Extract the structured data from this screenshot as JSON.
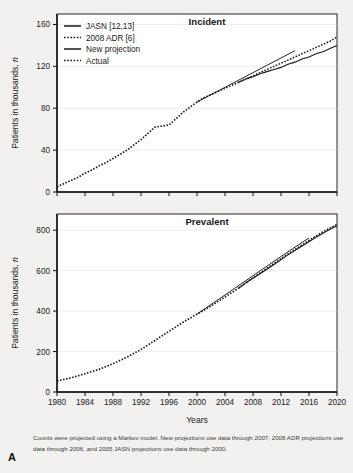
{
  "figure": {
    "panel_letter": "A",
    "caption": "Counts were projected using a Markov model. New projections use data through 2007, 2008 ADR projections use data through 2006, and 2005 JASN projections use data through 2000.",
    "xlabel": "Years"
  },
  "legend": {
    "position": "top-left",
    "items": [
      {
        "label": "JASN  [12,13]",
        "style": "solid"
      },
      {
        "label": "2008 ADR [6]",
        "style": "dotted"
      },
      {
        "label": "New projection",
        "style": "solid"
      },
      {
        "label": "Actual",
        "style": "dotted"
      }
    ]
  },
  "chart_data": [
    {
      "type": "line",
      "title": "Incident",
      "xlabel": "Years",
      "ylabel": "Patients in thousands, n",
      "xlim": [
        1980,
        2020
      ],
      "ylim": [
        0,
        170
      ],
      "yticks": [
        0,
        40,
        80,
        120,
        160
      ],
      "xticks": [
        1980,
        1984,
        1988,
        1992,
        1996,
        2000,
        2004,
        2008,
        2012,
        2016,
        2020
      ],
      "grid": true,
      "series": [
        {
          "name": "Actual",
          "style": "dotted",
          "x": [
            1980,
            1981,
            1982,
            1983,
            1984,
            1985,
            1986,
            1987,
            1988,
            1989,
            1990,
            1991,
            1992,
            1993,
            1994,
            1995,
            1996,
            1997,
            1998,
            1999,
            2000,
            2001,
            2002,
            2003,
            2004,
            2005,
            2006,
            2007
          ],
          "values": [
            5,
            8,
            11,
            14,
            18,
            21,
            25,
            28,
            32,
            36,
            40,
            45,
            50,
            56,
            62,
            63,
            64,
            70,
            76,
            81,
            86,
            90,
            93,
            96,
            99,
            102,
            105,
            108
          ]
        },
        {
          "name": "New projection",
          "style": "solid",
          "x": [
            2007,
            2008,
            2009,
            2010,
            2011,
            2012,
            2013,
            2014,
            2015,
            2016,
            2017,
            2018,
            2019,
            2020
          ],
          "values": [
            108,
            110,
            113,
            115,
            117,
            119,
            122,
            124,
            127,
            129,
            132,
            134,
            137,
            140
          ]
        },
        {
          "name": "2008 ADR [6]",
          "style": "dotted",
          "x": [
            2006,
            2007,
            2008,
            2009,
            2010,
            2011,
            2012,
            2013,
            2014,
            2015,
            2016,
            2017,
            2018,
            2019,
            2020
          ],
          "values": [
            105,
            108,
            111,
            114,
            117,
            120,
            123,
            126,
            129,
            132,
            135,
            138,
            141,
            144,
            148
          ]
        },
        {
          "name": "JASN [12,13]",
          "style": "solid",
          "x": [
            2000,
            2002,
            2004,
            2006,
            2008,
            2010,
            2012,
            2014
          ],
          "values": [
            86,
            93,
            100,
            107,
            114,
            121,
            128,
            135
          ]
        }
      ]
    },
    {
      "type": "line",
      "title": "Prevalent",
      "xlabel": "Years",
      "ylabel": "Patients in thousands, n",
      "xlim": [
        1980,
        2020
      ],
      "ylim": [
        0,
        880
      ],
      "yticks": [
        0,
        200,
        400,
        600,
        800
      ],
      "xticks": [
        1980,
        1984,
        1988,
        1992,
        1996,
        2000,
        2004,
        2008,
        2012,
        2016,
        2020
      ],
      "grid": true,
      "series": [
        {
          "name": "Actual",
          "style": "dotted",
          "x": [
            1980,
            1982,
            1984,
            1986,
            1988,
            1990,
            1992,
            1994,
            1996,
            1998,
            2000,
            2002,
            2004,
            2006,
            2007
          ],
          "values": [
            55,
            70,
            90,
            112,
            140,
            172,
            210,
            255,
            300,
            345,
            385,
            425,
            470,
            515,
            540
          ]
        },
        {
          "name": "New projection",
          "style": "solid",
          "x": [
            2007,
            2009,
            2011,
            2013,
            2015,
            2017,
            2019,
            2020
          ],
          "values": [
            540,
            585,
            630,
            678,
            722,
            765,
            805,
            822
          ]
        },
        {
          "name": "2008 ADR [6]",
          "style": "dotted",
          "x": [
            2006,
            2008,
            2010,
            2012,
            2014,
            2016,
            2018,
            2020
          ],
          "values": [
            515,
            565,
            612,
            660,
            705,
            750,
            793,
            828
          ]
        },
        {
          "name": "JASN [12,13]",
          "style": "solid",
          "x": [
            2000,
            2004,
            2008,
            2012,
            2016
          ],
          "values": [
            385,
            480,
            575,
            670,
            762
          ]
        }
      ]
    }
  ]
}
